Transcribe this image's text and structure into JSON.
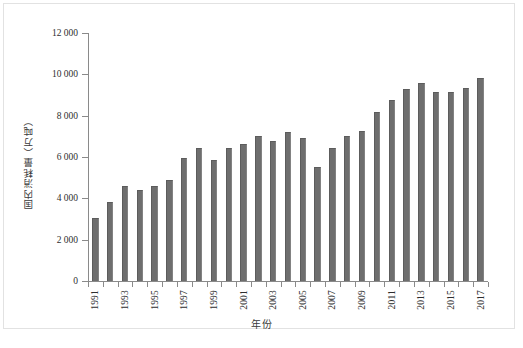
{
  "chart_data": {
    "type": "bar",
    "title": "",
    "xlabel": "年份",
    "ylabel": "国内消耗量（万吨）",
    "ylim": [
      0,
      12000
    ],
    "ytick_values": [
      0,
      2000,
      4000,
      6000,
      8000,
      10000,
      12000
    ],
    "ytick_labels": [
      "0",
      "2 000",
      "4 000",
      "6 000",
      "8 000",
      "10 000",
      "12 000"
    ],
    "xtick_labels": [
      "1991",
      "1993",
      "1995",
      "1997",
      "1999",
      "2001",
      "2003",
      "2005",
      "2007",
      "2009",
      "2011",
      "2013",
      "2015",
      "2017"
    ],
    "grid": false,
    "legend": null,
    "bar_color": "#6e6e6e",
    "axis_color": "#8a8a8a",
    "categories": [
      "1991",
      "1992",
      "1993",
      "1994",
      "1995",
      "1996",
      "1997",
      "1998",
      "1999",
      "2000",
      "2001",
      "2002",
      "2003",
      "2004",
      "2005",
      "2006",
      "2007",
      "2008",
      "2009",
      "2010",
      "2011",
      "2012",
      "2013",
      "2014",
      "2015",
      "2016",
      "2017"
    ],
    "values": [
      3050,
      3800,
      4620,
      4420,
      4620,
      4880,
      5960,
      6450,
      5850,
      6430,
      6630,
      7020,
      6780,
      7220,
      6900,
      5540,
      6420,
      7030,
      7280,
      8190,
      8780,
      9270,
      9590,
      9140,
      9140,
      9350,
      9830
    ]
  },
  "caption": {
    "text": ""
  }
}
